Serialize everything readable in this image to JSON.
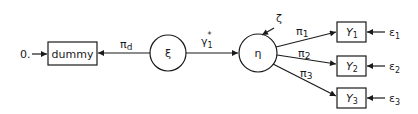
{
  "diagram": {
    "type": "path-diagram",
    "nodes": {
      "zero_input": {
        "label": "0."
      },
      "dummy": {
        "label": "dummy",
        "shape": "rectangle"
      },
      "xi": {
        "label": "ξ",
        "shape": "circle"
      },
      "eta": {
        "label": "η",
        "shape": "circle"
      },
      "zeta": {
        "label": "ζ"
      },
      "y1": {
        "label": "Y",
        "sub": "1",
        "shape": "rectangle"
      },
      "y2": {
        "label": "Y",
        "sub": "2",
        "shape": "rectangle"
      },
      "y3": {
        "label": "Y",
        "sub": "3",
        "shape": "rectangle"
      },
      "e1": {
        "label": "ε",
        "sub": "1"
      },
      "e2": {
        "label": "ε",
        "sub": "2"
      },
      "e3": {
        "label": "ε",
        "sub": "3"
      }
    },
    "edges": {
      "pi_d": {
        "label": "π",
        "sub": "d",
        "from": "xi",
        "to": "dummy"
      },
      "gamma": {
        "label": "γ",
        "sub": "1",
        "sup": "*",
        "from": "xi",
        "to": "eta"
      },
      "pi_1": {
        "label": "π",
        "sub": "1",
        "from": "eta",
        "to": "y1"
      },
      "pi_2": {
        "label": "π",
        "sub": "2",
        "from": "eta",
        "to": "y2"
      },
      "pi_3": {
        "label": "π",
        "sub": "3",
        "from": "eta",
        "to": "y3"
      }
    },
    "colors": {
      "stroke": "#1a1a1a",
      "background": "#ffffff"
    }
  }
}
